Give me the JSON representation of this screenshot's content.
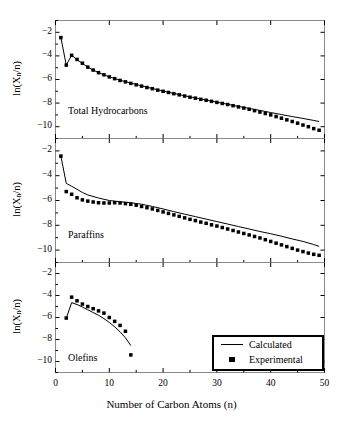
{
  "figure": {
    "background": "#ffffff",
    "ink": "#000000",
    "width": 343,
    "height": 426
  },
  "axis": {
    "xlabel": "Number of Carbon Atoms (n)",
    "ylabel_prefix": "ln(X",
    "ylabel_sub": "n",
    "ylabel_suffix": "/n)",
    "xticks": [
      0,
      10,
      20,
      30,
      40,
      50
    ],
    "yticks": [
      -2,
      -4,
      -6,
      -8,
      -10
    ],
    "xlim": [
      0,
      50
    ],
    "ylim": [
      -11,
      -1
    ]
  },
  "legend": {
    "position": "bottom-right",
    "items": [
      {
        "label": "Calculated",
        "symbol": "line"
      },
      {
        "label": "Experimental",
        "symbol": "square"
      }
    ]
  },
  "panels": [
    {
      "note": "Total Hydrocarbons"
    },
    {
      "note": "Paraffins"
    },
    {
      "note": "Olefins"
    }
  ],
  "chart_data": [
    {
      "type": "line",
      "title": "Total Hydrocarbons",
      "xlabel": "Number of Carbon Atoms (n)",
      "ylabel": "ln(Xn/n)",
      "xlim": [
        0,
        50
      ],
      "ylim": [
        -11,
        -1
      ],
      "xticks": [
        0,
        10,
        20,
        30,
        40,
        50
      ],
      "yticks": [
        -2,
        -4,
        -6,
        -8,
        -10
      ],
      "grid": false,
      "series": [
        {
          "name": "Experimental",
          "symbol": "square",
          "x": [
            1,
            2,
            3,
            4,
            5,
            6,
            7,
            8,
            9,
            10,
            11,
            12,
            13,
            14,
            15,
            16,
            17,
            18,
            19,
            20,
            21,
            22,
            23,
            24,
            25,
            26,
            27,
            28,
            29,
            30,
            31,
            32,
            33,
            34,
            35,
            36,
            37,
            38,
            39,
            40,
            41,
            42,
            43,
            44,
            45,
            46,
            47,
            48,
            49
          ],
          "y": [
            -2.45,
            -4.78,
            -3.95,
            -4.3,
            -4.62,
            -4.95,
            -5.2,
            -5.42,
            -5.6,
            -5.78,
            -5.93,
            -6.08,
            -6.2,
            -6.33,
            -6.45,
            -6.56,
            -6.68,
            -6.78,
            -6.9,
            -7.0,
            -7.1,
            -7.2,
            -7.3,
            -7.4,
            -7.5,
            -7.58,
            -7.68,
            -7.76,
            -7.85,
            -7.94,
            -8.03,
            -8.12,
            -8.22,
            -8.32,
            -8.42,
            -8.52,
            -8.64,
            -8.76,
            -8.88,
            -9.0,
            -9.14,
            -9.28,
            -9.42,
            -9.56,
            -9.7,
            -9.86,
            -10.0,
            -10.16,
            -10.3
          ]
        },
        {
          "name": "Calculated",
          "symbol": "line",
          "x": [
            1,
            2,
            3,
            4,
            5,
            6,
            7,
            8,
            9,
            10,
            12,
            14,
            16,
            18,
            20,
            22,
            24,
            26,
            28,
            30,
            32,
            34,
            36,
            38,
            40,
            42,
            44,
            46,
            48,
            49
          ],
          "y": [
            -2.45,
            -4.78,
            -3.95,
            -4.32,
            -4.64,
            -4.95,
            -5.2,
            -5.42,
            -5.6,
            -5.78,
            -6.06,
            -6.3,
            -6.54,
            -6.76,
            -6.98,
            -7.18,
            -7.38,
            -7.56,
            -7.74,
            -7.92,
            -8.1,
            -8.28,
            -8.45,
            -8.62,
            -8.8,
            -8.97,
            -9.14,
            -9.3,
            -9.47,
            -9.56
          ]
        }
      ]
    },
    {
      "type": "line",
      "title": "Paraffins",
      "xlabel": "Number of Carbon Atoms (n)",
      "ylabel": "ln(Xn/n)",
      "xlim": [
        0,
        50
      ],
      "ylim": [
        -11,
        -1
      ],
      "xticks": [
        0,
        10,
        20,
        30,
        40,
        50
      ],
      "yticks": [
        -2,
        -4,
        -6,
        -8,
        -10
      ],
      "grid": false,
      "series": [
        {
          "name": "Experimental",
          "symbol": "square",
          "x": [
            1,
            2,
            3,
            4,
            5,
            6,
            7,
            8,
            9,
            10,
            11,
            12,
            13,
            14,
            15,
            16,
            17,
            18,
            19,
            20,
            21,
            22,
            23,
            24,
            25,
            26,
            27,
            28,
            29,
            30,
            31,
            32,
            33,
            34,
            35,
            36,
            37,
            38,
            39,
            40,
            41,
            42,
            43,
            44,
            45,
            46,
            47,
            48,
            49
          ],
          "y": [
            -2.42,
            -5.28,
            -5.5,
            -5.78,
            -5.95,
            -6.05,
            -6.12,
            -6.18,
            -6.2,
            -6.2,
            -6.18,
            -6.2,
            -6.25,
            -6.3,
            -6.38,
            -6.48,
            -6.58,
            -6.68,
            -6.8,
            -6.92,
            -7.04,
            -7.16,
            -7.28,
            -7.4,
            -7.52,
            -7.62,
            -7.74,
            -7.84,
            -7.96,
            -8.06,
            -8.18,
            -8.3,
            -8.42,
            -8.54,
            -8.66,
            -8.78,
            -8.9,
            -9.02,
            -9.16,
            -9.3,
            -9.44,
            -9.58,
            -9.72,
            -9.86,
            -10.0,
            -10.12,
            -10.24,
            -10.34,
            -10.42
          ]
        },
        {
          "name": "Calculated",
          "symbol": "line",
          "x": [
            1,
            2,
            3,
            4,
            5,
            6,
            8,
            10,
            12,
            14,
            16,
            18,
            20,
            22,
            24,
            26,
            28,
            30,
            32,
            34,
            36,
            38,
            40,
            42,
            44,
            46,
            48,
            49
          ],
          "y": [
            -2.42,
            -4.62,
            -4.85,
            -5.1,
            -5.35,
            -5.55,
            -5.8,
            -6.0,
            -6.1,
            -6.18,
            -6.3,
            -6.48,
            -6.68,
            -6.9,
            -7.1,
            -7.3,
            -7.5,
            -7.7,
            -7.9,
            -8.1,
            -8.3,
            -8.5,
            -8.68,
            -8.88,
            -9.1,
            -9.3,
            -9.55,
            -9.7
          ]
        }
      ]
    },
    {
      "type": "line",
      "title": "Olefins",
      "xlabel": "Number of Carbon Atoms (n)",
      "ylabel": "ln(Xn/n)",
      "xlim": [
        0,
        50
      ],
      "ylim": [
        -11,
        -1
      ],
      "xticks": [
        0,
        10,
        20,
        30,
        40,
        50
      ],
      "yticks": [
        -2,
        -4,
        -6,
        -8,
        -10
      ],
      "grid": false,
      "series": [
        {
          "name": "Experimental",
          "symbol": "square",
          "x": [
            2,
            3,
            4,
            5,
            6,
            7,
            8,
            9,
            10,
            11,
            12,
            13,
            14
          ],
          "y": [
            -6.05,
            -4.15,
            -4.48,
            -4.78,
            -5.0,
            -5.2,
            -5.4,
            -5.6,
            -6.0,
            -6.35,
            -6.72,
            -7.25,
            -9.4
          ]
        },
        {
          "name": "Calculated",
          "symbol": "line",
          "x": [
            2,
            3,
            4,
            5,
            6,
            7,
            8,
            9,
            10,
            11,
            12,
            13,
            14
          ],
          "y": [
            -6.08,
            -4.65,
            -4.82,
            -5.05,
            -5.3,
            -5.55,
            -5.8,
            -6.1,
            -6.45,
            -6.85,
            -7.3,
            -7.85,
            -8.55
          ]
        }
      ]
    }
  ]
}
